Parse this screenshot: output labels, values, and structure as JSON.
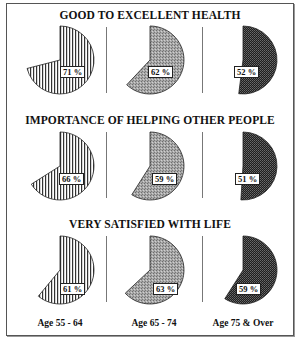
{
  "chart_data": {
    "type": "pie",
    "categories": [
      "Age 55 - 64",
      "Age 65 - 74",
      "Age 75 & Over"
    ],
    "series": [
      {
        "name": "GOOD TO EXCELLENT HEALTH",
        "values": [
          71,
          62,
          52
        ],
        "labels": [
          "71 %",
          "62 %",
          "52 %"
        ]
      },
      {
        "name": "IMPORTANCE OF HELPING OTHER PEOPLE",
        "values": [
          66,
          59,
          51
        ],
        "labels": [
          "66 %",
          "59 %",
          "51 %"
        ]
      },
      {
        "name": "VERY SATISFIED WITH LIFE",
        "values": [
          61,
          63,
          59
        ],
        "labels": [
          "61 %",
          "63 %",
          "59 %"
        ]
      }
    ],
    "title": "",
    "xlabel": "",
    "ylabel": "",
    "fill_patterns": [
      "vertical-stripes",
      "light-gray-stipple",
      "dark-checker"
    ],
    "start_angle": "12 o'clock, clockwise",
    "legend": "none (age groups labeled below columns)"
  },
  "sections": [
    {
      "title": "GOOD TO EXCELLENT HEALTH"
    },
    {
      "title": "IMPORTANCE OF HELPING OTHER PEOPLE"
    },
    {
      "title": "VERY SATISFIED WITH LIFE"
    }
  ],
  "age_labels": [
    "Age 55 - 64",
    "Age 65 - 74",
    "Age 75 & Over"
  ],
  "colors": {
    "stripe_fill": "#ffffff",
    "stripe_line": "#333333",
    "mid_gray": "#9a9a9a",
    "dark": "#2a2a2a",
    "border": "#555555"
  }
}
